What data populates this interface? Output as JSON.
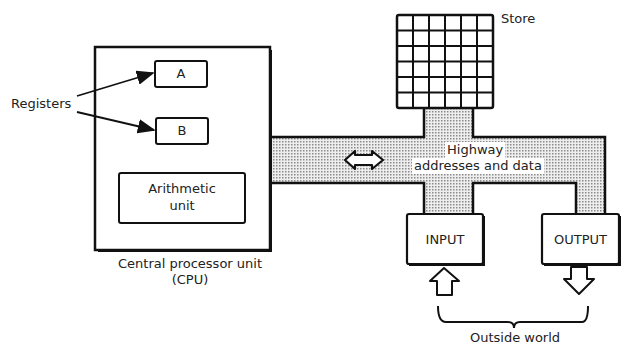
{
  "diagram": {
    "cpu": {
      "label_line1": "Central processor unit",
      "label_line2": "(CPU)",
      "register_a": "A",
      "register_b": "B",
      "alu_line1": "Arithmetic",
      "alu_line2": "unit"
    },
    "registers_label": "Registers",
    "store_label": "Store",
    "store_grid": {
      "rows": 6,
      "cols": 6
    },
    "highway": {
      "line1": "Highway",
      "line2": "addresses and data"
    },
    "input_label": "INPUT",
    "output_label": "OUTPUT",
    "outside_world_label": "Outside world",
    "colors": {
      "line": "#111111",
      "highway_fill": "#d9d9d9",
      "background": "#ffffff"
    }
  }
}
